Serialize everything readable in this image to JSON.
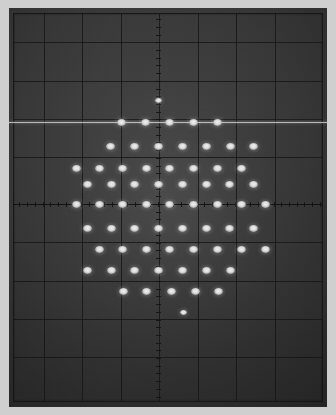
{
  "display": {
    "device_label": "crt-oscilloscope-screen",
    "screen_bg_color": "#3c3c3c",
    "graticule_color": "#141414",
    "dot_color": "#ffffff",
    "bezel_color": "#cfcfcf",
    "scanline_color": "#ececec"
  },
  "graticule": {
    "type": "rectangular-graticule",
    "divisions_x": 8,
    "divisions_y": 10,
    "cell_width_px": 38.5,
    "cell_height_px": 38.5,
    "origin_x_px": 158,
    "origin_y_px": 204,
    "vertical_lines_px": [
      44,
      82,
      121,
      159,
      198,
      236,
      275
    ],
    "horizontal_lines_px": [
      42,
      81,
      119,
      157,
      204,
      242,
      281,
      319,
      357
    ],
    "center_axis_x_px": 158,
    "center_axis_y_px": 204,
    "minor_tick_count_per_div": 5,
    "scanline_y_px": 122
  },
  "chart_data": {
    "type": "scatter",
    "title": "",
    "subtitle": "",
    "xlabel": "",
    "ylabel": "",
    "legend": [],
    "grid": true,
    "legend_position": "none",
    "xlim": [
      0,
      336
    ],
    "ylim": [
      415,
      0
    ],
    "units": "screen-pixels",
    "point_count": 69,
    "rows": [
      {
        "row": 1,
        "y": 100,
        "x": [
          158
        ]
      },
      {
        "row": 2,
        "y": 122,
        "x": [
          121,
          145,
          169,
          193,
          217
        ]
      },
      {
        "row": 3,
        "y": 146,
        "x": [
          110,
          134,
          158,
          182,
          206,
          230,
          253
        ]
      },
      {
        "row": 4,
        "y": 168,
        "x": [
          76,
          99,
          122,
          146,
          169,
          193,
          217,
          241
        ]
      },
      {
        "row": 5,
        "y": 184,
        "x": [
          87,
          111,
          134,
          158,
          182,
          206,
          229,
          253
        ]
      },
      {
        "row": 6,
        "y": 204,
        "x": [
          76,
          99,
          122,
          146,
          169,
          193,
          217,
          241,
          265
        ]
      },
      {
        "row": 7,
        "y": 228,
        "x": [
          87,
          111,
          134,
          158,
          182,
          206,
          229,
          253
        ]
      },
      {
        "row": 8,
        "y": 249,
        "x": [
          99,
          122,
          146,
          169,
          193,
          217,
          241,
          265
        ]
      },
      {
        "row": 9,
        "y": 270,
        "x": [
          87,
          111,
          134,
          158,
          182,
          206,
          230
        ]
      },
      {
        "row": 10,
        "y": 291,
        "x": [
          123,
          146,
          171,
          195,
          218
        ]
      },
      {
        "row": 11,
        "y": 312,
        "x": [
          183
        ]
      }
    ]
  }
}
